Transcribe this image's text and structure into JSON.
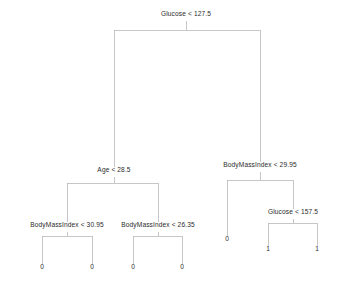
{
  "figure": {
    "background_color": "#ffffff",
    "edge_color": "#b9b9bd",
    "text_color": "#2b2b2b",
    "width": 340,
    "height": 291
  },
  "chart_data": {
    "type": "diagram",
    "diagram_type": "decision-tree",
    "title": "",
    "xlabel": "",
    "ylabel": "",
    "features": [
      "Glucose",
      "Age",
      "BodyMassIndex"
    ],
    "class_labels": [
      "0",
      "1"
    ],
    "nodes": [
      {
        "id": "n0",
        "kind": "split",
        "label": "Glucose < 127.5",
        "feature": "Glucose",
        "threshold": 127.5,
        "x": 186,
        "y": 16,
        "depth": 0,
        "parent": null,
        "branch": null
      },
      {
        "id": "n1",
        "kind": "split",
        "label": "Age < 28.5",
        "feature": "Age",
        "threshold": 28.5,
        "x": 114,
        "y": 172,
        "depth": 1,
        "parent": "n0",
        "branch": "left"
      },
      {
        "id": "n2",
        "kind": "split",
        "label": "BodyMassIndex < 29.95",
        "feature": "BodyMassIndex",
        "threshold": 29.95,
        "x": 260,
        "y": 167,
        "depth": 1,
        "parent": "n0",
        "branch": "right"
      },
      {
        "id": "n3",
        "kind": "split",
        "label": "BodyMassIndex < 30.95",
        "feature": "BodyMassIndex",
        "threshold": 30.95,
        "x": 67,
        "y": 227,
        "depth": 2,
        "parent": "n1",
        "branch": "left"
      },
      {
        "id": "n4",
        "kind": "split",
        "label": "BodyMassIndex < 26.35",
        "feature": "BodyMassIndex",
        "threshold": 26.35,
        "x": 158,
        "y": 227,
        "depth": 2,
        "parent": "n1",
        "branch": "right"
      },
      {
        "id": "n5",
        "kind": "leaf",
        "label": "0",
        "value": "0",
        "x": 227,
        "y": 241,
        "depth": 2,
        "parent": "n2",
        "branch": "left"
      },
      {
        "id": "n6",
        "kind": "split",
        "label": "Glucose < 157.5",
        "feature": "Glucose",
        "threshold": 157.5,
        "x": 293,
        "y": 214,
        "depth": 2,
        "parent": "n2",
        "branch": "right"
      },
      {
        "id": "n7",
        "kind": "leaf",
        "label": "0",
        "value": "0",
        "x": 42,
        "y": 269,
        "depth": 3,
        "parent": "n3",
        "branch": "left"
      },
      {
        "id": "n8",
        "kind": "leaf",
        "label": "0",
        "value": "0",
        "x": 92,
        "y": 269,
        "depth": 3,
        "parent": "n3",
        "branch": "right"
      },
      {
        "id": "n9",
        "kind": "leaf",
        "label": "0",
        "value": "0",
        "x": 133,
        "y": 269,
        "depth": 3,
        "parent": "n4",
        "branch": "left"
      },
      {
        "id": "n10",
        "kind": "leaf",
        "label": "0",
        "value": "0",
        "x": 182,
        "y": 269,
        "depth": 3,
        "parent": "n4",
        "branch": "right"
      },
      {
        "id": "n11",
        "kind": "leaf",
        "label": "1",
        "value": "1",
        "x": 268,
        "y": 251,
        "depth": 3,
        "parent": "n6",
        "branch": "left"
      },
      {
        "id": "n12",
        "kind": "leaf",
        "label": "1",
        "value": "1",
        "x": 317,
        "y": 251,
        "depth": 3,
        "parent": "n6",
        "branch": "right"
      }
    ],
    "edges": [
      {
        "id": "e0",
        "from": "n0",
        "to": "n1",
        "bus_y": 30,
        "branch": "left"
      },
      {
        "id": "e1",
        "from": "n0",
        "to": "n2",
        "bus_y": 30,
        "branch": "right"
      },
      {
        "id": "e2",
        "from": "n1",
        "to": "n3",
        "bus_y": 183,
        "branch": "left"
      },
      {
        "id": "e3",
        "from": "n1",
        "to": "n4",
        "bus_y": 183,
        "branch": "right"
      },
      {
        "id": "e4",
        "from": "n2",
        "to": "n5",
        "bus_y": 180,
        "branch": "left"
      },
      {
        "id": "e5",
        "from": "n2",
        "to": "n6",
        "bus_y": 180,
        "branch": "right"
      },
      {
        "id": "e6",
        "from": "n3",
        "to": "n7",
        "bus_y": 236,
        "branch": "left"
      },
      {
        "id": "e7",
        "from": "n3",
        "to": "n8",
        "bus_y": 236,
        "branch": "right"
      },
      {
        "id": "e8",
        "from": "n4",
        "to": "n9",
        "bus_y": 236,
        "branch": "left"
      },
      {
        "id": "e9",
        "from": "n4",
        "to": "n10",
        "bus_y": 236,
        "branch": "right"
      },
      {
        "id": "e10",
        "from": "n6",
        "to": "n11",
        "bus_y": 223,
        "branch": "left"
      },
      {
        "id": "e11",
        "from": "n6",
        "to": "n12",
        "bus_y": 223,
        "branch": "right"
      }
    ]
  }
}
